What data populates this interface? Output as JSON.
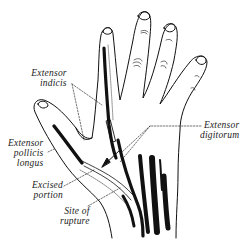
{
  "diagram": {
    "colors": {
      "ink": "#111111",
      "background": "#ffffff",
      "label": "#222222"
    },
    "labels": [
      {
        "id": "extensor-indicis",
        "lines": [
          "Extensor",
          "indicis"
        ]
      },
      {
        "id": "extensor-pollicis-longus",
        "lines": [
          "Extensor",
          "pollicis",
          "longus"
        ]
      },
      {
        "id": "excised-portion",
        "lines": [
          "Excised",
          "portion"
        ]
      },
      {
        "id": "site-of-rupture",
        "lines": [
          "Site of",
          "rupture"
        ]
      },
      {
        "id": "extensor-digitorum",
        "lines": [
          "Extensor",
          "digitorum"
        ]
      }
    ]
  }
}
